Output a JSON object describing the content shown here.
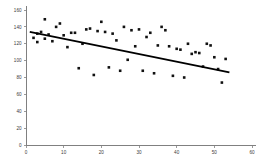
{
  "chart_data": {
    "type": "scatter",
    "title": "",
    "subtitle": "",
    "xlabel": "",
    "ylabel": "",
    "xlim": [
      0,
      60
    ],
    "ylim": [
      0,
      160
    ],
    "grid": false,
    "legend": "none",
    "xticks": [
      0,
      10,
      20,
      30,
      40,
      50,
      60
    ],
    "yticks": [
      0,
      20,
      40,
      60,
      80,
      100,
      120,
      140,
      160
    ],
    "point_color": "#111111",
    "trendline_color": "#000000",
    "axis_color": "#808080",
    "series": [
      {
        "name": "observations",
        "points": [
          [
            2,
            127
          ],
          [
            3,
            132
          ],
          [
            3,
            122
          ],
          [
            4,
            134
          ],
          [
            5,
            149
          ],
          [
            5,
            126
          ],
          [
            6,
            131
          ],
          [
            7,
            123
          ],
          [
            8,
            140
          ],
          [
            9,
            144
          ],
          [
            10,
            130
          ],
          [
            11,
            116
          ],
          [
            12,
            133
          ],
          [
            13,
            133
          ],
          [
            14,
            91
          ],
          [
            15,
            120
          ],
          [
            16,
            137
          ],
          [
            17,
            138
          ],
          [
            18,
            83
          ],
          [
            19,
            135
          ],
          [
            20,
            146
          ],
          [
            21,
            134
          ],
          [
            22,
            92
          ],
          [
            23,
            132
          ],
          [
            24,
            124
          ],
          [
            25,
            88
          ],
          [
            26,
            140
          ],
          [
            27,
            101
          ],
          [
            28,
            136
          ],
          [
            29,
            117
          ],
          [
            30,
            137
          ],
          [
            31,
            88
          ],
          [
            32,
            128
          ],
          [
            33,
            133
          ],
          [
            34,
            85
          ],
          [
            35,
            118
          ],
          [
            36,
            140
          ],
          [
            37,
            136
          ],
          [
            38,
            117
          ],
          [
            39,
            82
          ],
          [
            40,
            114
          ],
          [
            41,
            113
          ],
          [
            42,
            80
          ],
          [
            43,
            120
          ],
          [
            44,
            108
          ],
          [
            45,
            110
          ],
          [
            46,
            109
          ],
          [
            47,
            93
          ],
          [
            48,
            120
          ],
          [
            49,
            118
          ],
          [
            50,
            104
          ],
          [
            51,
            90
          ],
          [
            52,
            74
          ],
          [
            53,
            102
          ]
        ]
      }
    ],
    "trendline": {
      "name": "linear-fit",
      "x_start": 1,
      "y_start": 134,
      "x_end": 54,
      "y_end": 86
    }
  }
}
